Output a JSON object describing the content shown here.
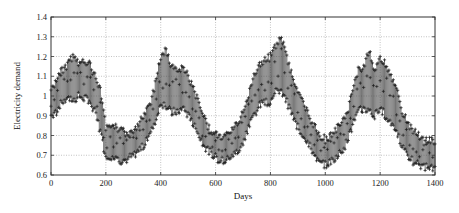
{
  "chart_data": {
    "type": "errorbar",
    "title": "",
    "xlabel": "Days",
    "ylabel": "Electricity demand",
    "xlim": [
      0,
      1400
    ],
    "ylim": [
      0.6,
      1.4
    ],
    "xticks": [
      0,
      200,
      400,
      600,
      800,
      1000,
      1200,
      1400
    ],
    "yticks": [
      0.6,
      0.7,
      0.8,
      0.9,
      1,
      1.1,
      1.2,
      1.3,
      1.4
    ],
    "grid": true,
    "legend": null,
    "marker": "+",
    "series": [
      {
        "name": "daily demand range",
        "x": [
          0,
          20,
          40,
          60,
          80,
          100,
          120,
          140,
          160,
          180,
          200,
          220,
          240,
          260,
          280,
          300,
          320,
          340,
          360,
          380,
          400,
          420,
          440,
          460,
          480,
          500,
          520,
          540,
          560,
          580,
          600,
          620,
          640,
          660,
          680,
          700,
          720,
          740,
          760,
          780,
          800,
          820,
          840,
          860,
          880,
          900,
          920,
          940,
          960,
          980,
          1000,
          1020,
          1040,
          1060,
          1080,
          1100,
          1120,
          1140,
          1160,
          1180,
          1200,
          1220,
          1240,
          1260,
          1280,
          1300,
          1320,
          1340,
          1360,
          1380,
          1400
        ],
        "upper": [
          1.05,
          1.1,
          1.15,
          1.18,
          1.22,
          1.18,
          1.2,
          1.19,
          1.12,
          1.05,
          0.86,
          0.85,
          0.86,
          0.84,
          0.83,
          0.85,
          0.88,
          0.92,
          0.97,
          1.08,
          1.22,
          1.25,
          1.17,
          1.15,
          1.17,
          1.12,
          1.05,
          0.98,
          0.9,
          0.85,
          0.83,
          0.8,
          0.82,
          0.85,
          0.88,
          0.93,
          1.03,
          1.12,
          1.17,
          1.2,
          1.22,
          1.27,
          1.32,
          1.22,
          1.12,
          1.05,
          0.98,
          0.92,
          0.87,
          0.82,
          0.8,
          0.82,
          0.85,
          0.88,
          0.93,
          1.05,
          1.15,
          1.17,
          1.25,
          1.15,
          1.22,
          1.18,
          1.12,
          1.05,
          0.95,
          0.88,
          0.85,
          0.82,
          0.79,
          0.8,
          0.79
        ],
        "lower": [
          0.88,
          0.9,
          0.95,
          0.97,
          0.95,
          0.98,
          0.97,
          0.96,
          0.9,
          0.8,
          0.66,
          0.67,
          0.66,
          0.65,
          0.66,
          0.68,
          0.7,
          0.73,
          0.78,
          0.85,
          0.95,
          0.92,
          0.9,
          0.9,
          0.92,
          0.88,
          0.83,
          0.78,
          0.72,
          0.7,
          0.67,
          0.65,
          0.66,
          0.67,
          0.7,
          0.75,
          0.82,
          0.88,
          0.93,
          0.95,
          0.95,
          1.0,
          1.0,
          0.95,
          0.88,
          0.82,
          0.78,
          0.74,
          0.68,
          0.64,
          0.63,
          0.65,
          0.67,
          0.7,
          0.75,
          0.83,
          0.9,
          0.92,
          0.9,
          0.88,
          0.92,
          0.88,
          0.85,
          0.8,
          0.72,
          0.68,
          0.65,
          0.63,
          0.62,
          0.62,
          0.62
        ]
      }
    ]
  },
  "plot": {
    "x_axis_title": "Days",
    "y_axis_title": "Electricity demand"
  }
}
